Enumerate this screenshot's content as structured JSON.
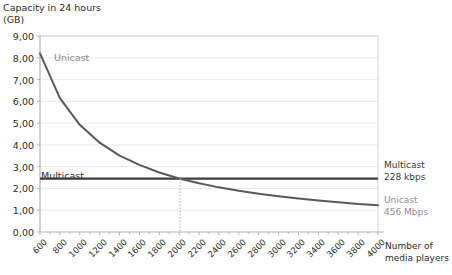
{
  "axes": {
    "y_title": "Capacity in 24 hours\n(GB)",
    "x_title": "Number of\nmedia players",
    "y_ticks": [
      "0,00",
      "1,00",
      "2,00",
      "3,00",
      "4,00",
      "5,00",
      "6,00",
      "7,00",
      "8,00",
      "9,00"
    ],
    "x_ticks": [
      "600",
      "800",
      "1000",
      "1200",
      "1400",
      "1600",
      "1800",
      "2000",
      "2200",
      "2400",
      "2600",
      "2800",
      "3000",
      "3200",
      "3400",
      "3600",
      "3800",
      "4000"
    ]
  },
  "annotations": {
    "curve_label_unicast": "Unicast",
    "line_label_multicast": "Multicast",
    "right_multicast": "Multicast\n228 kbps",
    "right_unicast": "Unicast\n456 Mbps"
  },
  "colors": {
    "unicast": "#595959",
    "multicast": "#3d3d3d",
    "grid": "#e8e8e8",
    "axis": "#b3b3b3",
    "guide": "#aaaaaa",
    "text": "#2b2b2b",
    "muted_text": "#8c8c8c"
  },
  "chart_data": {
    "type": "line",
    "title": "",
    "subtitle": "",
    "xlabel": "Number of media players",
    "ylabel": "Capacity in 24 hours (GB)",
    "xlim": [
      600,
      4000
    ],
    "ylim": [
      0,
      9
    ],
    "grid": true,
    "legend_position": "right-inline",
    "x": [
      600,
      800,
      1000,
      1200,
      1400,
      1600,
      1800,
      2000,
      2200,
      2400,
      2600,
      2800,
      3000,
      3200,
      3400,
      3600,
      3800,
      4000
    ],
    "series": [
      {
        "name": "Unicast",
        "detail": "456 Mbps",
        "color": "#595959",
        "values": [
          8.2,
          6.15,
          4.92,
          4.1,
          3.51,
          3.08,
          2.73,
          2.46,
          2.24,
          2.05,
          1.89,
          1.76,
          1.64,
          1.54,
          1.45,
          1.37,
          1.29,
          1.23
        ]
      },
      {
        "name": "Multicast",
        "detail": "228 kbps",
        "color": "#3d3d3d",
        "values": [
          2.45,
          2.45,
          2.45,
          2.45,
          2.45,
          2.45,
          2.45,
          2.45,
          2.45,
          2.45,
          2.45,
          2.45,
          2.45,
          2.45,
          2.45,
          2.45,
          2.45,
          2.45
        ]
      }
    ],
    "intersection": {
      "x": 2010,
      "y": 2.45,
      "marker": "dotted-vertical-drop-line"
    }
  }
}
